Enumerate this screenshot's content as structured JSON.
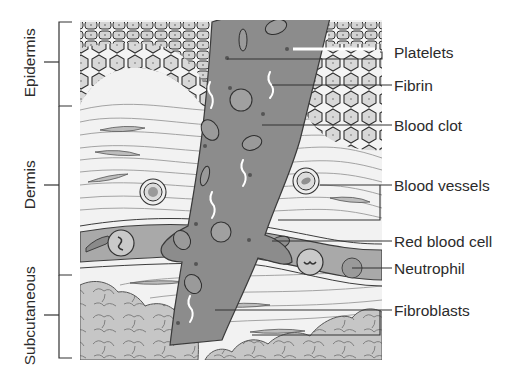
{
  "diagram": {
    "type": "anatomical cross-section",
    "layers": [
      {
        "label": "Epidermis",
        "y_range": [
          22,
          106
        ]
      },
      {
        "label": "Dermis",
        "y_range": [
          106,
          275
        ]
      },
      {
        "label": "Subcutaneous",
        "y_range": [
          275,
          358
        ]
      }
    ],
    "callouts": [
      {
        "label": "Platelets"
      },
      {
        "label": "Fibrin"
      },
      {
        "label": "Blood clot"
      },
      {
        "label": "Blood vessels"
      },
      {
        "label": "Red blood cell"
      },
      {
        "label": "Neutrophil"
      },
      {
        "label": "Fibroblasts"
      }
    ],
    "colors": {
      "clot": "#8c8c8c",
      "clot_outline": "#3a3a3a",
      "epidermis_cell": "#d6d6d6",
      "dermis_bg": "#f1f1f1",
      "vessel": "#a8a8a8",
      "fat": "#c4c4c4",
      "line": "#444444",
      "text": "#2b2b2b"
    }
  }
}
